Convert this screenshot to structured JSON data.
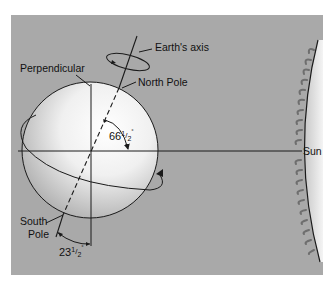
{
  "diagram": {
    "labels": {
      "earths_axis": "Earth's axis",
      "perpendicular": "Perpendicular",
      "north_pole": "North Pole",
      "south_pole_line1": "South",
      "south_pole_line2": "Pole",
      "sun": "Sun"
    },
    "angles": {
      "axis_to_plane": {
        "whole": "66",
        "frac_num": "1",
        "frac_den": "2",
        "unit": "°"
      },
      "axis_tilt": {
        "whole": "23",
        "frac_num": "1",
        "frac_den": "2",
        "unit": "°"
      }
    },
    "colors": {
      "background_panel": "#a9a9a9",
      "page": "#ffffff",
      "line": "#1a1a1a",
      "sun_flame": "#6e6e6e"
    }
  }
}
